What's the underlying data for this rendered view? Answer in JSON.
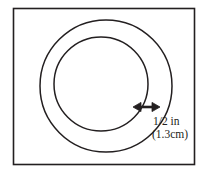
{
  "figure": {
    "name": "annulus-width-diagram",
    "frame": {
      "stroke_color": "#231f20",
      "fill_color": "#ffffff",
      "x": 13,
      "y": 8,
      "width": 182,
      "height": 157
    },
    "outer_circle": {
      "cx": 106,
      "cy": 86,
      "r": 66,
      "stroke_color": "#231f20"
    },
    "inner_circle": {
      "cx": 101,
      "cy": 84,
      "r": 47,
      "stroke_color": "#231f20"
    },
    "dimension_arrow": {
      "x1": 134,
      "x2": 159,
      "y": 107,
      "color": "#231f20",
      "style": "double-headed"
    },
    "label": {
      "line1": "1/2 in",
      "line2": "(1.3cm)",
      "color": "#231f20"
    }
  }
}
